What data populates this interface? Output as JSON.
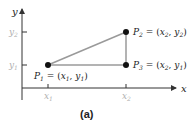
{
  "diagram": {
    "axes": {
      "x_label": "x",
      "y_label": "y",
      "x_ticks": [
        {
          "main": "x",
          "sub": "1"
        },
        {
          "main": "x",
          "sub": "2"
        }
      ],
      "y_ticks": [
        {
          "main": "y",
          "sub": "2"
        },
        {
          "main": "y",
          "sub": "1"
        }
      ]
    },
    "points": [
      {
        "name": "P",
        "sub": "1",
        "eq": " = (",
        "a": "x",
        "asub": "1",
        "sep": ", ",
        "b": "y",
        "bsub": "1",
        "close": ")"
      },
      {
        "name": "P",
        "sub": "2",
        "eq": " = (",
        "a": "x",
        "asub": "2",
        "sep": ", ",
        "b": "y",
        "bsub": "2",
        "close": ")"
      },
      {
        "name": "P",
        "sub": "3",
        "eq": " = (",
        "a": "x",
        "asub": "2",
        "sep": ", ",
        "b": "y",
        "bsub": "1",
        "close": ")"
      }
    ],
    "caption": "(a)",
    "colors": {
      "axis": "#333333",
      "triangle": "#9a9a9a",
      "tick_label": "#b0b0b0",
      "point": "#111111",
      "text": "#222222"
    }
  }
}
